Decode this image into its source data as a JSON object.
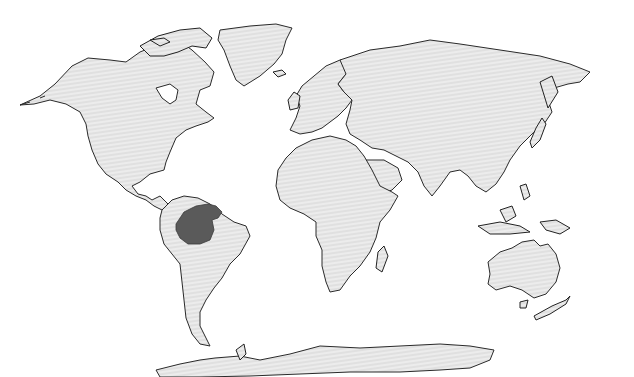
{
  "map": {
    "title": "",
    "projection": "world (Robinson-like)",
    "land_fill": "#e4e4e4",
    "land_stroke": "#2a2a2a",
    "background": "#ffffff",
    "highlight": {
      "label": "",
      "region": "Northern South America (Amazon basin)",
      "color": "#5a5a5a"
    },
    "regions": [
      "North America",
      "Greenland",
      "South America",
      "Europe",
      "Africa",
      "Asia",
      "Australia",
      "New Zealand",
      "Antarctica"
    ]
  }
}
